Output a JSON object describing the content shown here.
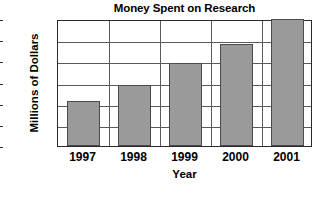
{
  "chart_data": {
    "type": "bar",
    "title": "Money Spent on Research",
    "xlabel": "Year",
    "ylabel": "Millions of Dollars",
    "categories": [
      "1997",
      "1998",
      "1999",
      "2000",
      "2001"
    ],
    "values": [
      6.4,
      8.7,
      11.8,
      14.5,
      18
    ],
    "ylim": [
      0,
      18
    ],
    "yticks": [
      0,
      3,
      6,
      9,
      12,
      15,
      18
    ],
    "ytick_labels": [
      "0",
      "3",
      "6",
      "9",
      "12",
      "15",
      "18"
    ],
    "grid": "horizontal-and-vertical",
    "legend": "none",
    "bar_color": "#9a9a9a",
    "bar_edge_color": "#4a4a4a",
    "gridline_color": "#5a5a5a",
    "axis_color": "#2a2a2a",
    "background": "#ffffff"
  }
}
